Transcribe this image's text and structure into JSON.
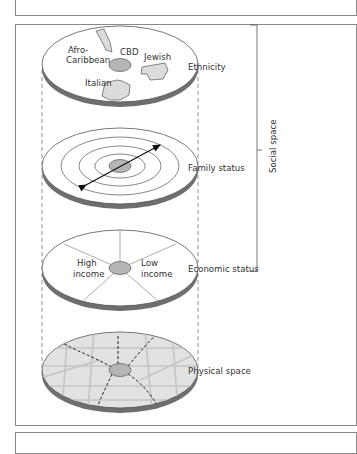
{
  "diagram": {
    "layers": [
      {
        "id": "ethnicity",
        "label": "Ethnicity",
        "regions": [
          "Afro-Caribbean",
          "CBD",
          "Jewish",
          "Italian"
        ],
        "region_lines": {
          "afro1": "Afro-",
          "afro2": "Caribbean",
          "cbd": "CBD",
          "jewish": "Jewish",
          "italian": "Italian"
        }
      },
      {
        "id": "family-status",
        "label": "Family status",
        "pattern": "concentric rings with bidirectional arrow"
      },
      {
        "id": "economic-status",
        "label": "Economic status",
        "pattern": "sectors",
        "sector_lines": {
          "high1": "High",
          "high2": "income",
          "low1": "Low",
          "low2": "income"
        }
      },
      {
        "id": "physical-space",
        "label": "Physical space",
        "pattern": "street grid with dashed radial routes"
      }
    ],
    "bracket_label": "Social space",
    "bracket_spans": [
      "Ethnicity",
      "Family status",
      "Economic status"
    ]
  },
  "colors": {
    "disc_top": "#ffffff",
    "disc_side": "#6e6e6e",
    "cbd_fill": "#b5b5b5",
    "region_fill": "#dcdcdc",
    "physical_fill": "#e2e2e2",
    "stroke": "#555555",
    "frame": "#8a8a8a"
  }
}
